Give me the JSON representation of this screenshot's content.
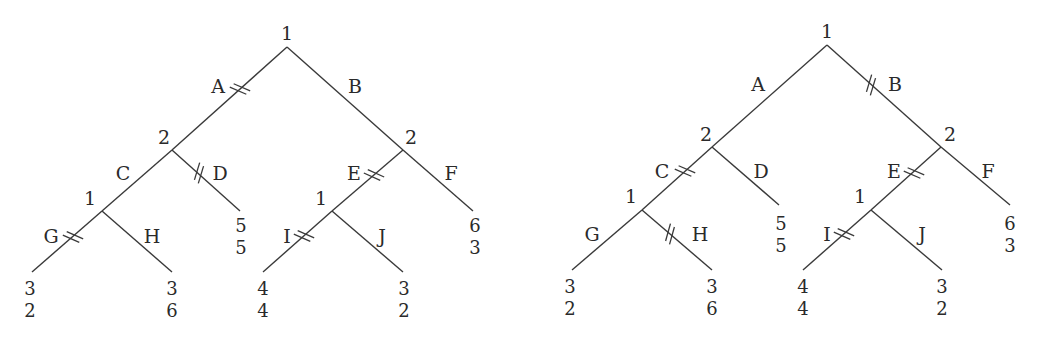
{
  "figure": {
    "trees": [
      {
        "id": "left",
        "nodes": {
          "root": {
            "player": "1",
            "x": 287,
            "y": 47,
            "lx": 287,
            "ly": 40
          },
          "n2L": {
            "player": "2",
            "x": 172,
            "y": 150,
            "lx": 164,
            "ly": 144
          },
          "n2R": {
            "player": "2",
            "x": 403,
            "y": 150,
            "lx": 411,
            "ly": 144
          },
          "n1L": {
            "player": "1",
            "x": 102,
            "y": 211,
            "lx": 90,
            "ly": 205
          },
          "n1R": {
            "player": "1",
            "x": 332,
            "y": 211,
            "lx": 321,
            "ly": 205
          }
        },
        "edges": [
          {
            "label": "A",
            "from": "root",
            "to": "n2L",
            "x1": 287,
            "y1": 47,
            "x2": 172,
            "y2": 150,
            "lx": 218,
            "ly": 93,
            "cut": true,
            "cx": 240,
            "cy": 89
          },
          {
            "label": "B",
            "from": "root",
            "to": "n2R",
            "x1": 287,
            "y1": 47,
            "x2": 403,
            "y2": 150,
            "lx": 355,
            "ly": 93,
            "cut": false
          },
          {
            "label": "C",
            "from": "n2L",
            "to": "n1L",
            "x1": 172,
            "y1": 150,
            "x2": 102,
            "y2": 211,
            "lx": 123,
            "ly": 180,
            "cut": false
          },
          {
            "label": "D",
            "from": "n2L",
            "to": "leafD",
            "x1": 172,
            "y1": 150,
            "x2": 240,
            "y2": 211,
            "lx": 220,
            "ly": 180,
            "cut": true,
            "cx": 199,
            "cy": 173
          },
          {
            "label": "E",
            "from": "n2R",
            "to": "n1R",
            "x1": 403,
            "y1": 150,
            "x2": 332,
            "y2": 211,
            "lx": 354,
            "ly": 180,
            "cut": true,
            "cx": 374,
            "cy": 175
          },
          {
            "label": "F",
            "from": "n2R",
            "to": "leafF",
            "x1": 403,
            "y1": 150,
            "x2": 473,
            "y2": 211,
            "lx": 451,
            "ly": 180,
            "cut": false
          },
          {
            "label": "G",
            "from": "n1L",
            "to": "leafG",
            "x1": 102,
            "y1": 211,
            "x2": 32,
            "y2": 272,
            "lx": 51,
            "ly": 243,
            "cut": true,
            "cx": 73,
            "cy": 237
          },
          {
            "label": "H",
            "from": "n1L",
            "to": "leafH",
            "x1": 102,
            "y1": 211,
            "x2": 172,
            "y2": 272,
            "lx": 152,
            "ly": 243,
            "cut": false
          },
          {
            "label": "I",
            "from": "n1R",
            "to": "leafI",
            "x1": 332,
            "y1": 211,
            "x2": 263,
            "y2": 272,
            "lx": 287,
            "ly": 243,
            "cut": true,
            "cx": 304,
            "cy": 236
          },
          {
            "label": "J",
            "from": "n1R",
            "to": "leafJ",
            "x1": 332,
            "y1": 211,
            "x2": 403,
            "y2": 272,
            "lx": 382,
            "ly": 243,
            "cut": false
          }
        ],
        "payoffs": [
          {
            "leaf": "leafG",
            "p1": "3",
            "p2": "2",
            "x": 30,
            "y": 295
          },
          {
            "leaf": "leafH",
            "p1": "3",
            "p2": "6",
            "x": 172,
            "y": 295
          },
          {
            "leaf": "leafD",
            "p1": "5",
            "p2": "5",
            "x": 241,
            "y": 232
          },
          {
            "leaf": "leafI",
            "p1": "4",
            "p2": "4",
            "x": 263,
            "y": 295
          },
          {
            "leaf": "leafJ",
            "p1": "3",
            "p2": "2",
            "x": 404,
            "y": 295
          },
          {
            "leaf": "leafF",
            "p1": "6",
            "p2": "3",
            "x": 475,
            "y": 232
          }
        ]
      },
      {
        "id": "right",
        "nodes": {
          "root": {
            "player": "1",
            "x": 827,
            "y": 45,
            "lx": 827,
            "ly": 38
          },
          "n2L": {
            "player": "2",
            "x": 712,
            "y": 147,
            "lx": 706,
            "ly": 141
          },
          "n2R": {
            "player": "2",
            "x": 941,
            "y": 147,
            "lx": 950,
            "ly": 141
          },
          "n1L": {
            "player": "1",
            "x": 642,
            "y": 210,
            "lx": 631,
            "ly": 203
          },
          "n1R": {
            "player": "1",
            "x": 871,
            "y": 210,
            "lx": 860,
            "ly": 203
          }
        },
        "edges": [
          {
            "label": "A",
            "from": "root",
            "to": "n2L",
            "x1": 827,
            "y1": 45,
            "x2": 712,
            "y2": 147,
            "lx": 758,
            "ly": 91,
            "cut": false
          },
          {
            "label": "B",
            "from": "root",
            "to": "n2R",
            "x1": 827,
            "y1": 45,
            "x2": 941,
            "y2": 147,
            "lx": 895,
            "ly": 91,
            "cut": true,
            "cx": 871,
            "cy": 85
          },
          {
            "label": "C",
            "from": "n2L",
            "to": "n1L",
            "x1": 712,
            "y1": 147,
            "x2": 642,
            "y2": 210,
            "lx": 662,
            "ly": 178,
            "cut": true,
            "cx": 685,
            "cy": 171
          },
          {
            "label": "D",
            "from": "n2L",
            "to": "leafD",
            "x1": 712,
            "y1": 147,
            "x2": 779,
            "y2": 205,
            "lx": 761,
            "ly": 178,
            "cut": false
          },
          {
            "label": "E",
            "from": "n2R",
            "to": "n1R",
            "x1": 941,
            "y1": 147,
            "x2": 871,
            "y2": 210,
            "lx": 894,
            "ly": 178,
            "cut": true,
            "cx": 914,
            "cy": 173
          },
          {
            "label": "F",
            "from": "n2R",
            "to": "leafF",
            "x1": 941,
            "y1": 147,
            "x2": 1010,
            "y2": 205,
            "lx": 988,
            "ly": 178,
            "cut": false
          },
          {
            "label": "G",
            "from": "n1L",
            "to": "leafG",
            "x1": 642,
            "y1": 210,
            "x2": 572,
            "y2": 270,
            "lx": 592,
            "ly": 241,
            "cut": false
          },
          {
            "label": "H",
            "from": "n1L",
            "to": "leafH",
            "x1": 642,
            "y1": 210,
            "x2": 712,
            "y2": 270,
            "lx": 700,
            "ly": 241,
            "cut": true,
            "cx": 670,
            "cy": 234
          },
          {
            "label": "I",
            "from": "n1R",
            "to": "leafI",
            "x1": 871,
            "y1": 210,
            "x2": 803,
            "y2": 270,
            "lx": 827,
            "ly": 241,
            "cut": true,
            "cx": 844,
            "cy": 234
          },
          {
            "label": "J",
            "from": "n1R",
            "to": "leafJ",
            "x1": 871,
            "y1": 210,
            "x2": 942,
            "y2": 270,
            "lx": 922,
            "ly": 241,
            "cut": false
          }
        ],
        "payoffs": [
          {
            "leaf": "leafG",
            "p1": "3",
            "p2": "2",
            "x": 570,
            "y": 293
          },
          {
            "leaf": "leafH",
            "p1": "3",
            "p2": "6",
            "x": 712,
            "y": 293
          },
          {
            "leaf": "leafD",
            "p1": "5",
            "p2": "5",
            "x": 781,
            "y": 230
          },
          {
            "leaf": "leafI",
            "p1": "4",
            "p2": "4",
            "x": 803,
            "y": 293
          },
          {
            "leaf": "leafJ",
            "p1": "3",
            "p2": "2",
            "x": 942,
            "y": 293
          },
          {
            "leaf": "leafF",
            "p1": "6",
            "p2": "3",
            "x": 1010,
            "y": 230
          }
        ]
      }
    ]
  }
}
